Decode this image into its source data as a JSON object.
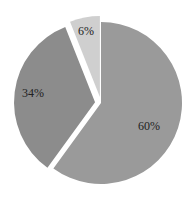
{
  "chart_data": {
    "type": "pie",
    "title": "",
    "categories": [
      "A",
      "B",
      "C"
    ],
    "values": [
      60,
      34,
      6
    ],
    "labels": [
      "60%",
      "34%",
      "6%"
    ],
    "colors": [
      "#9a9a9a",
      "#8c8c8c",
      "#cfcfcf"
    ],
    "exploded": [
      false,
      true,
      true
    ],
    "start_angle_deg": 0,
    "direction": "clockwise",
    "legend": "none"
  }
}
